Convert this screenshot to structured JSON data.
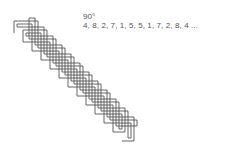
{
  "figure": {
    "angle_label": "90°",
    "sequence_label": "4, 8, 2, 7, 1, 5, 5, 1, 7, 2, 8, 4 ...",
    "angle_degrees": 90,
    "sequence": [
      4,
      8,
      2,
      7,
      1,
      5,
      5,
      1,
      7,
      2,
      8,
      4
    ],
    "stroke_color": "#555555",
    "background": "#ffffff"
  }
}
